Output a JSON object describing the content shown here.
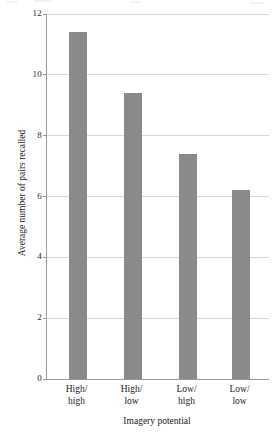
{
  "chart_data": {
    "type": "bar",
    "title": "",
    "subtitle": "",
    "xlabel": "Imagery potential",
    "ylabel": "Average number of pairs recalled",
    "categories": [
      "High/\nhigh",
      "High/\nlow",
      "Low/\nhigh",
      "Low/\nlow"
    ],
    "category_lines": [
      [
        "High/",
        "high"
      ],
      [
        "High/",
        "low"
      ],
      [
        "Low/",
        "high"
      ],
      [
        "Low/",
        "low"
      ]
    ],
    "values": [
      11.4,
      9.4,
      7.4,
      6.2
    ],
    "ylim": [
      0,
      12
    ],
    "yticks": [
      0,
      2,
      4,
      6,
      8,
      10,
      12
    ],
    "ytick_labels": [
      "0",
      "2",
      "4",
      "6",
      "8",
      "10",
      "12"
    ],
    "grid": true,
    "grid_axis": "y",
    "legend": false,
    "legend_position": "none",
    "bar_color": "#8a8a8a",
    "gridline_color": "#d8d8d8",
    "axis_color": "#9a9a9a",
    "background_color": "#ffffff"
  }
}
